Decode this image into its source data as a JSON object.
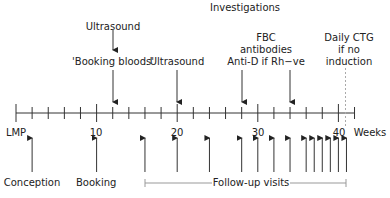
{
  "title": "Investigations",
  "axis": {
    "start_label": "LMP",
    "unit_label": "Weeks",
    "ticks_every_weeks": 2,
    "labeled_ticks": [
      "10",
      "20",
      "30",
      "40"
    ],
    "range_weeks": [
      0,
      42
    ],
    "dotted_marker_week": 41
  },
  "investigations": [
    {
      "label": "Ultrasound",
      "week": 12,
      "stacked": true
    },
    {
      "label": "'Booking bloods'",
      "week": 12
    },
    {
      "label": "Ultrasound",
      "week": 20
    },
    {
      "label_lines": [
        "FBC",
        "antibodies",
        "Anti-D if Rh−ve"
      ],
      "weeks": [
        28,
        34
      ]
    },
    {
      "label_lines": [
        "Daily CTG",
        "if no",
        "induction"
      ],
      "week": 41
    }
  ],
  "events": [
    {
      "label": "Conception",
      "week": 2
    },
    {
      "label": "Booking",
      "week": 10
    }
  ],
  "follow_up": {
    "label": "Follow-up visits",
    "weeks": [
      16,
      20,
      24,
      28,
      30,
      32,
      34,
      36,
      37,
      38,
      39,
      40,
      41
    ]
  },
  "text": {
    "title": "Investigations",
    "ultrasound_1": "Ultrasound",
    "booking_bloods": "'Booking bloods'",
    "ultrasound_2": "Ultrasound",
    "fbc": "FBC",
    "antibodies": "antibodies",
    "antid": "Anti-D if Rh−ve",
    "ctg_1": "Daily CTG",
    "ctg_2": "if no",
    "ctg_3": "induction",
    "lmp": "LMP",
    "t10": "10",
    "t20": "20",
    "t30": "30",
    "t40": "40",
    "weeks": "Weeks",
    "conception": "Conception",
    "booking": "Booking",
    "follow_up": "Follow-up visits"
  }
}
